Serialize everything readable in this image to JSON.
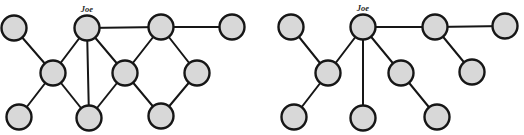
{
  "figure": {
    "background": "#ffffff",
    "width": 524,
    "height": 135
  },
  "styles": {
    "node_fill": "#d8d8d8",
    "node_stroke": "#161616",
    "node_radius": 12.5,
    "node_stroke_width": 2.4,
    "edge_stroke": "#161616",
    "edge_stroke_width": 2,
    "label_color": "#2a2a2a",
    "label_font_size": 8.5
  },
  "graphs": [
    {
      "name": "left-graph",
      "description": "network-with-cycles",
      "nodes": [
        {
          "id": "top-left",
          "x": 14,
          "y": 28,
          "label": ""
        },
        {
          "id": "joe",
          "x": 87,
          "y": 28,
          "label": "Joe"
        },
        {
          "id": "top-right",
          "x": 161,
          "y": 27,
          "label": ""
        },
        {
          "id": "far-top-right",
          "x": 232,
          "y": 27,
          "label": ""
        },
        {
          "id": "mid-left",
          "x": 53,
          "y": 73,
          "label": ""
        },
        {
          "id": "center",
          "x": 125,
          "y": 73,
          "label": ""
        },
        {
          "id": "mid-right",
          "x": 197,
          "y": 73,
          "label": ""
        },
        {
          "id": "bottom-left",
          "x": 19,
          "y": 117,
          "label": ""
        },
        {
          "id": "bottom-center",
          "x": 89,
          "y": 118,
          "label": ""
        },
        {
          "id": "bottom-right",
          "x": 161,
          "y": 116,
          "label": ""
        }
      ],
      "edges": [
        [
          "top-left",
          "mid-left"
        ],
        [
          "mid-left",
          "bottom-left"
        ],
        [
          "mid-left",
          "joe"
        ],
        [
          "mid-left",
          "bottom-center"
        ],
        [
          "joe",
          "bottom-center"
        ],
        [
          "joe",
          "center"
        ],
        [
          "joe",
          "top-right"
        ],
        [
          "top-right",
          "far-top-right"
        ],
        [
          "top-right",
          "center"
        ],
        [
          "top-right",
          "mid-right"
        ],
        [
          "center",
          "bottom-center"
        ],
        [
          "center",
          "bottom-right"
        ],
        [
          "mid-right",
          "bottom-right"
        ]
      ]
    },
    {
      "name": "right-graph",
      "description": "spanning-tree",
      "nodes": [
        {
          "id": "top-left",
          "x": 291,
          "y": 27,
          "label": ""
        },
        {
          "id": "joe",
          "x": 363,
          "y": 27,
          "label": "Joe"
        },
        {
          "id": "top-right",
          "x": 435,
          "y": 27,
          "label": ""
        },
        {
          "id": "far-top-right",
          "x": 505,
          "y": 26,
          "label": ""
        },
        {
          "id": "mid-left",
          "x": 328,
          "y": 73,
          "label": ""
        },
        {
          "id": "center",
          "x": 401,
          "y": 73,
          "label": ""
        },
        {
          "id": "mid-right",
          "x": 472,
          "y": 72,
          "label": ""
        },
        {
          "id": "bottom-left",
          "x": 294,
          "y": 117,
          "label": ""
        },
        {
          "id": "bottom-center",
          "x": 363,
          "y": 118,
          "label": ""
        },
        {
          "id": "bottom-right",
          "x": 437,
          "y": 117,
          "label": ""
        }
      ],
      "edges": [
        [
          "top-left",
          "mid-left"
        ],
        [
          "mid-left",
          "bottom-left"
        ],
        [
          "mid-left",
          "joe"
        ],
        [
          "joe",
          "bottom-center"
        ],
        [
          "joe",
          "center"
        ],
        [
          "joe",
          "top-right"
        ],
        [
          "top-right",
          "far-top-right"
        ],
        [
          "top-right",
          "mid-right"
        ],
        [
          "center",
          "bottom-right"
        ]
      ]
    }
  ]
}
